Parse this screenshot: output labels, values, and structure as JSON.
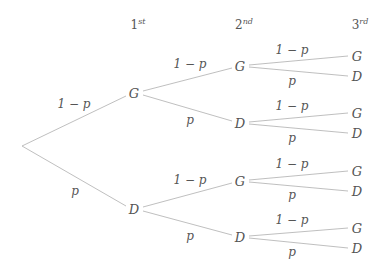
{
  "diagram": {
    "type": "probability-tree",
    "headers": [
      {
        "num": "1",
        "suffix": "st",
        "x": 138,
        "y": 24
      },
      {
        "num": "2",
        "suffix": "nd",
        "x": 244,
        "y": 24
      },
      {
        "num": "3",
        "suffix": "rd",
        "x": 360,
        "y": 24
      }
    ],
    "root": {
      "x": 22,
      "y": 146
    },
    "edge_color": "#b8b8b8",
    "text_color": "#555555",
    "nodes": [
      {
        "id": "l1g",
        "label": "G",
        "x": 134,
        "y": 93
      },
      {
        "id": "l1d",
        "label": "D",
        "x": 134,
        "y": 209
      },
      {
        "id": "l2gg",
        "label": "G",
        "x": 240,
        "y": 66
      },
      {
        "id": "l2gd",
        "label": "D",
        "x": 240,
        "y": 123
      },
      {
        "id": "l2dg",
        "label": "G",
        "x": 240,
        "y": 181
      },
      {
        "id": "l2dd",
        "label": "D",
        "x": 240,
        "y": 237
      },
      {
        "id": "l3a",
        "label": "G",
        "x": 357,
        "y": 56
      },
      {
        "id": "l3b",
        "label": "D",
        "x": 357,
        "y": 76
      },
      {
        "id": "l3c",
        "label": "G",
        "x": 357,
        "y": 113
      },
      {
        "id": "l3d",
        "label": "D",
        "x": 357,
        "y": 133
      },
      {
        "id": "l3e",
        "label": "G",
        "x": 357,
        "y": 171
      },
      {
        "id": "l3f",
        "label": "D",
        "x": 357,
        "y": 191
      },
      {
        "id": "l3g",
        "label": "G",
        "x": 357,
        "y": 228
      },
      {
        "id": "l3h",
        "label": "D",
        "x": 357,
        "y": 248
      }
    ],
    "edge_labels": [
      {
        "text": "1 − p",
        "x": 74,
        "y": 104
      },
      {
        "text": "p",
        "x": 75,
        "y": 191
      },
      {
        "text": "1 − p",
        "x": 190,
        "y": 64
      },
      {
        "text": "p",
        "x": 190,
        "y": 120
      },
      {
        "text": "1 − p",
        "x": 190,
        "y": 180
      },
      {
        "text": "p",
        "x": 190,
        "y": 236
      },
      {
        "text": "1 − p",
        "x": 292,
        "y": 50
      },
      {
        "text": "p",
        "x": 292,
        "y": 81
      },
      {
        "text": "1 − p",
        "x": 292,
        "y": 106
      },
      {
        "text": "p",
        "x": 292,
        "y": 138
      },
      {
        "text": "1 − p",
        "x": 292,
        "y": 164
      },
      {
        "text": "p",
        "x": 292,
        "y": 195
      },
      {
        "text": "1 − p",
        "x": 292,
        "y": 220
      },
      {
        "text": "p",
        "x": 292,
        "y": 252
      }
    ]
  }
}
